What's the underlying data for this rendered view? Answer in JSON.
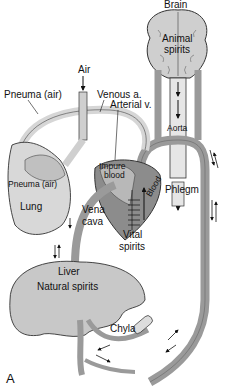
{
  "figure": {
    "panel_label": "A",
    "colors": {
      "organ_fill": "#c8c8c8",
      "vessel_fill": "#9a9a9a",
      "vessel_light": "#d6d6d6",
      "heart_dark": "#6e6e6e",
      "outline": "#333333"
    }
  },
  "labels": {
    "brain": "Brain",
    "animal": "Animal",
    "spirits_brain": "spirits",
    "air": "Air",
    "pneuma_air_top": "Pneuma (air)",
    "venous_a": "Venous a.",
    "arterial_v": "Arterial v.",
    "aorta": "Aorta",
    "impure": "Impure",
    "blood_left": "blood",
    "blood_right": "Blood",
    "phlegm": "Phlegm",
    "pneuma_air_lung": "Pneuma (air)",
    "lung": "Lung",
    "vena": "Vena",
    "cava": "cava",
    "vital": "Vital",
    "spirits_vital": "spirits",
    "liver": "Liver",
    "natural_spirits": "Natural spirits",
    "chyla": "Chyla"
  }
}
